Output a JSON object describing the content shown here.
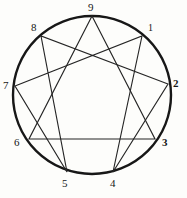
{
  "diagram": {
    "background_color": "#fdfdfb",
    "circle_color": "#171717",
    "line_color": "#252525",
    "geometry": {
      "center_x": 92,
      "center_y": 95,
      "radius": 79
    },
    "points": [
      {
        "label": "9",
        "position": "top",
        "x": 92,
        "y": 16,
        "label_x": 88,
        "label_y": 2,
        "style": "normal"
      },
      {
        "label": "1",
        "position": "upper-right",
        "x": 142,
        "y": 36,
        "label_x": 148,
        "label_y": 22,
        "style": "smallcap"
      },
      {
        "label": "2",
        "position": "right",
        "x": 168,
        "y": 84,
        "label_x": 173,
        "label_y": 78,
        "style": "bold"
      },
      {
        "label": "3",
        "position": "lower-right",
        "x": 155,
        "y": 139,
        "label_x": 162,
        "label_y": 137,
        "style": "bold"
      },
      {
        "label": "4",
        "position": "bottom-right",
        "x": 113,
        "y": 172,
        "label_x": 110,
        "label_y": 178,
        "style": "normal"
      },
      {
        "label": "5",
        "position": "bottom-left",
        "x": 67,
        "y": 172,
        "label_x": 62,
        "label_y": 178,
        "style": "normal"
      },
      {
        "label": "6",
        "position": "lower-left",
        "x": 29,
        "y": 139,
        "label_x": 14,
        "label_y": 137,
        "style": "normal"
      },
      {
        "label": "7",
        "position": "left",
        "x": 15,
        "y": 86,
        "label_x": 3,
        "label_y": 80,
        "style": "normal"
      },
      {
        "label": "8",
        "position": "upper-left",
        "x": 41,
        "y": 36,
        "label_x": 31,
        "label_y": 22,
        "style": "normal"
      }
    ],
    "triangle": {
      "name": "inner-triangle-9-3-6",
      "path": "M 92 16 L 155 139 L 29 139 Z"
    },
    "hexad": {
      "name": "hexad-1-4-2-8-5-7",
      "path": "M 142 36 L 113 172 L 168 84 L 41 36 L 67 172 L 15 86 Z"
    }
  }
}
